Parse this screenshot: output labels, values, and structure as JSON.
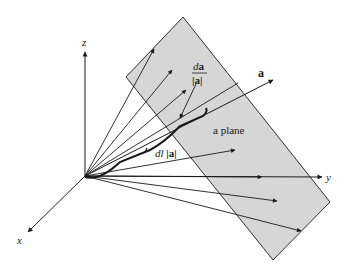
{
  "figure": {
    "axes": {
      "x_label": "x",
      "y_label": "y",
      "z_label": "z"
    },
    "labels": {
      "vector_a": "a",
      "plane": "a plane",
      "da_numerator_d": "d",
      "da_numerator_a": "a",
      "da_denominator": "|a|",
      "dl_prefix": "dl ",
      "dl_abs": "|a|"
    },
    "colors": {
      "plane_fill": "#d6d6d6",
      "line": "#1a1a1a",
      "background": "#ffffff"
    }
  }
}
